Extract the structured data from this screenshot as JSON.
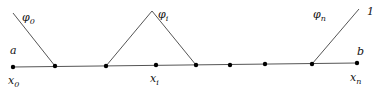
{
  "diagram": {
    "labels": {
      "phi0": "φ",
      "phi0_sub": "0",
      "phii": "φ",
      "phii_sub": "i",
      "phin": "φ",
      "phin_sub": "n",
      "one": "1",
      "a": "a",
      "b": "b",
      "x0": "x",
      "x0_sub": "0",
      "xi": "x",
      "xi_sub": "i",
      "xn": "x",
      "xn_sub": "n"
    },
    "nodes": [
      {
        "x": 13,
        "y": 67
      },
      {
        "x": 55,
        "y": 66
      },
      {
        "x": 106,
        "y": 66
      },
      {
        "x": 156,
        "y": 65
      },
      {
        "x": 196,
        "y": 65
      },
      {
        "x": 230,
        "y": 65
      },
      {
        "x": 265,
        "y": 64
      },
      {
        "x": 312,
        "y": 64
      },
      {
        "x": 357,
        "y": 63
      }
    ],
    "colors": {
      "line": "#555555",
      "node": "#000000"
    }
  }
}
